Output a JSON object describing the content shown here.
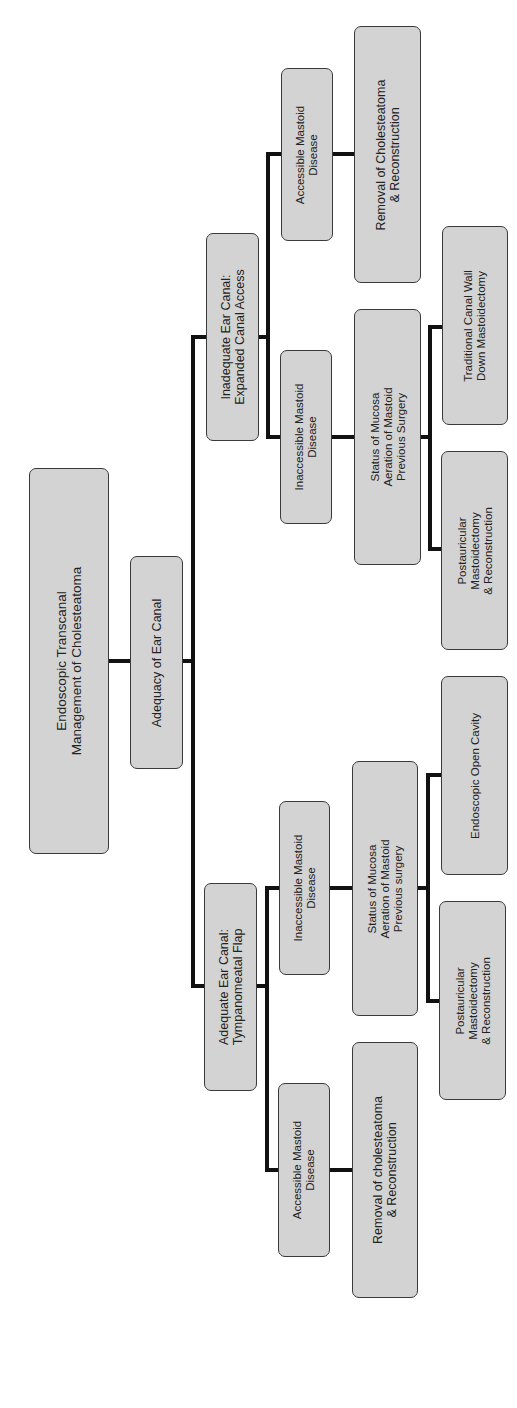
{
  "diagram": {
    "orientation": "rotated-90-ccw",
    "colors": {
      "node_fill": "#d3d3d3",
      "node_border": "#3a3a3a",
      "edge": "#111111",
      "text": "#222222",
      "background": "#ffffff"
    },
    "root": {
      "label": "Endoscopic Transcanal\nManagement of Cholesteatoma"
    },
    "level1": {
      "label": "Adequacy of Ear Canal"
    },
    "branches": {
      "inadequate": {
        "label": "Inadequate Ear Canal:\nExpanded Canal Access",
        "accessible": {
          "label": "Accessible Mastoid\nDisease",
          "outcome": {
            "label": "Removal of Cholesteatoma\n& Reconstruction"
          }
        },
        "inaccessible": {
          "label": "Inaccessible Mastoid\nDisease",
          "status": {
            "label": "Status of Mucosa\nAeration of Mastoid\nPrevious Surgery"
          },
          "options": [
            {
              "label": "Traditional Canal Wall\nDown Mastoidectomy"
            },
            {
              "label": "Postauricular\nMastoidectomy\n& Reconstruction"
            }
          ]
        }
      },
      "adequate": {
        "label": "Adequate Ear Canal:\nTympanomeatal Flap",
        "inaccessible": {
          "label": "Inaccessible Mastoid\nDisease",
          "status": {
            "label": "Status of Mucosa\nAeration of Mastoid\nPrevious surgery"
          },
          "options": [
            {
              "label": "Endoscopic Open Cavity"
            },
            {
              "label": "Postauricular\nMastoidectomy\n& Reconstruction"
            }
          ]
        },
        "accessible": {
          "label": "Accessible Mastoid\nDisease",
          "outcome": {
            "label": "Removal of cholesteatoma\n& Reconstruction"
          }
        }
      }
    }
  }
}
